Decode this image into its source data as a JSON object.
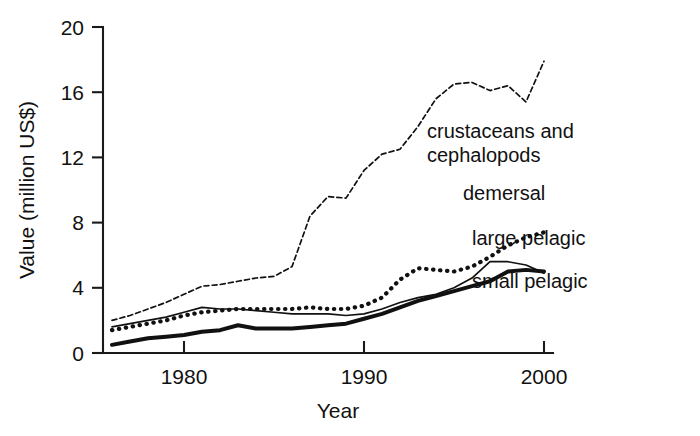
{
  "chart_data": {
    "type": "line",
    "title": "",
    "xlabel": "Year",
    "ylabel": "Value (million US$)",
    "xlim": [
      1975.5,
      2000.5
    ],
    "ylim": [
      0,
      20
    ],
    "xticks": [
      1980,
      1990,
      2000
    ],
    "xtick_labels": [
      "1980",
      "1990",
      "2000"
    ],
    "yticks": [
      0,
      4,
      8,
      12,
      16,
      20
    ],
    "ytick_labels": [
      "0",
      "4",
      "8",
      "12",
      "16",
      "20"
    ],
    "grid": false,
    "legend": "inline-labels-right",
    "x": [
      1976,
      1977,
      1978,
      1979,
      1980,
      1981,
      1982,
      1983,
      1984,
      1985,
      1986,
      1987,
      1988,
      1989,
      1990,
      1991,
      1992,
      1993,
      1994,
      1995,
      1996,
      1997,
      1998,
      1999,
      2000
    ],
    "series": [
      {
        "name": "crustaceans and cephalopods",
        "style": "fine-dashed",
        "label_lines": [
          "crustaceans and",
          "cephalopods"
        ],
        "values": [
          2.0,
          2.3,
          2.7,
          3.1,
          3.6,
          4.1,
          4.2,
          4.4,
          4.6,
          4.7,
          5.3,
          8.4,
          9.6,
          9.5,
          11.2,
          12.2,
          12.5,
          13.9,
          15.6,
          16.5,
          16.6,
          16.1,
          16.4,
          15.4,
          17.9
        ]
      },
      {
        "name": "demersal",
        "style": "bold-dotted",
        "label_lines": [
          "demersal"
        ],
        "values": [
          1.4,
          1.6,
          1.8,
          2.0,
          2.3,
          2.5,
          2.6,
          2.7,
          2.7,
          2.7,
          2.7,
          2.8,
          2.7,
          2.7,
          2.9,
          3.4,
          4.5,
          5.2,
          5.1,
          5.0,
          5.3,
          5.9,
          6.6,
          7.1,
          7.4
        ]
      },
      {
        "name": "large pelagic",
        "style": "thin-solid",
        "label_lines": [
          "large pelagic"
        ],
        "values": [
          1.6,
          1.8,
          2.0,
          2.2,
          2.5,
          2.8,
          2.7,
          2.7,
          2.6,
          2.5,
          2.4,
          2.4,
          2.4,
          2.3,
          2.4,
          2.7,
          3.1,
          3.4,
          3.6,
          4.0,
          4.6,
          5.6,
          5.6,
          5.4,
          4.9
        ]
      },
      {
        "name": "small pelagic",
        "style": "bold-solid",
        "label_lines": [
          "small pelagic"
        ],
        "values": [
          0.5,
          0.7,
          0.9,
          1.0,
          1.1,
          1.3,
          1.4,
          1.7,
          1.5,
          1.5,
          1.5,
          1.6,
          1.7,
          1.8,
          2.1,
          2.4,
          2.8,
          3.2,
          3.5,
          3.8,
          4.1,
          4.4,
          5.0,
          5.1,
          5.0
        ]
      }
    ],
    "annotations": [
      {
        "name": "crustaceans-label",
        "text": "crustaceans and cephalopods",
        "x": 1993.5,
        "y": 13.2
      },
      {
        "name": "demersal-label",
        "text": "demersal",
        "x": 1995.5,
        "y": 9.4
      },
      {
        "name": "large-pelagic-label",
        "text": "large pelagic",
        "x": 1996.0,
        "y": 6.6
      },
      {
        "name": "small-pelagic-label",
        "text": "small pelagic",
        "x": 1996.0,
        "y": 4.0
      }
    ],
    "colors": {
      "axis": "#1a1a1a",
      "text": "#111111",
      "lines": "#111111",
      "background": "#ffffff"
    }
  }
}
